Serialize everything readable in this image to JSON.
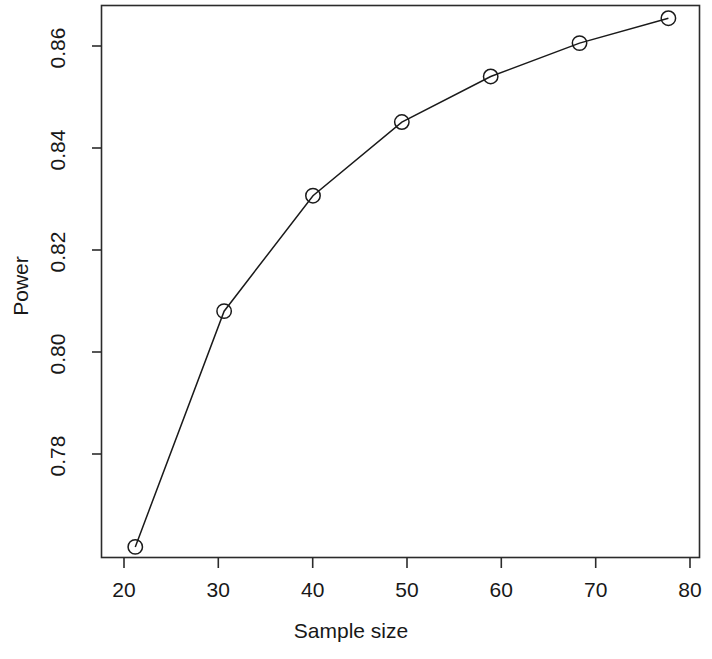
{
  "chart_data": {
    "type": "line",
    "title": "",
    "xlabel": "Sample size",
    "ylabel": "Power",
    "x": [
      20,
      30,
      40,
      50,
      60,
      70,
      80
    ],
    "values": [
      0.7643,
      0.8088,
      0.8306,
      0.8445,
      0.8531,
      0.8594,
      0.8641
    ],
    "series": [
      {
        "name": "Power",
        "x": [
          20,
          30,
          40,
          50,
          60,
          70,
          80
        ],
        "values": [
          0.7643,
          0.8088,
          0.8306,
          0.8445,
          0.8531,
          0.8594,
          0.8641
        ]
      }
    ],
    "xticks": [
      20,
      30,
      40,
      50,
      60,
      70,
      80
    ],
    "xtick_labels": [
      "20",
      "30",
      "40",
      "50",
      "60",
      "70",
      "80"
    ],
    "yticks": [
      0.78,
      0.8,
      0.82,
      0.84,
      0.86
    ],
    "ytick_labels": [
      "0.78",
      "0.80",
      "0.82",
      "0.84",
      "0.86"
    ],
    "xlim": [
      16.2,
      83.5
    ],
    "ylim": [
      0.7623,
      0.8665
    ],
    "grid": false,
    "legend": false,
    "legend_position": "none",
    "marker": "open-circle",
    "line_color": "#1a1a1a",
    "marker_color": "#1a1a1a",
    "background_color": "#ffffff",
    "frame": "box"
  },
  "axis": {
    "x_title": "Sample size",
    "y_title": "Power",
    "x_tick_labels": [
      "20",
      "30",
      "40",
      "50",
      "60",
      "70",
      "80"
    ],
    "y_tick_labels": [
      "0.78",
      "0.80",
      "0.82",
      "0.84",
      "0.86"
    ]
  }
}
